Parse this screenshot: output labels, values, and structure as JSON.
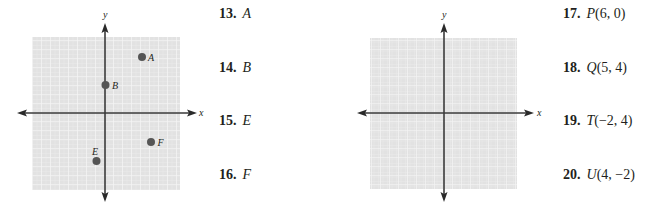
{
  "left_graph": {
    "x_axis_label": "x",
    "y_axis_label": "y",
    "points": [
      {
        "label": "A",
        "x": 4,
        "y": 6
      },
      {
        "label": "B",
        "x": 0,
        "y": 3
      },
      {
        "label": "E",
        "x": -1,
        "y": -5
      },
      {
        "label": "F",
        "x": 5,
        "y": -3
      }
    ]
  },
  "right_graph": {
    "x_axis_label": "x",
    "y_axis_label": "y",
    "points": []
  },
  "problems_left": [
    {
      "number": "13.",
      "label": "A"
    },
    {
      "number": "14.",
      "label": "B"
    },
    {
      "number": "15.",
      "label": "E"
    },
    {
      "number": "16.",
      "label": "F"
    }
  ],
  "problems_right": [
    {
      "number": "17.",
      "label": "P",
      "coords": "(6, 0)"
    },
    {
      "number": "18.",
      "label": "Q",
      "coords": "(5, 4)"
    },
    {
      "number": "19.",
      "label": "T",
      "coords": "(−2, 4)"
    },
    {
      "number": "20.",
      "label": "U",
      "coords": "(4, −2)"
    }
  ],
  "colors": {
    "grid_fill": "#e4e4e4",
    "grid_line": "#f7f7f7",
    "axis": "#3a3a3a",
    "point": "#555555",
    "text": "#231f20"
  }
}
